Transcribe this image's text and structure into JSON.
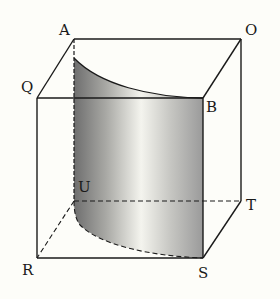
{
  "diagram": {
    "type": "3d-geometry",
    "labels": {
      "A": "A",
      "O": "O",
      "Q": "Q",
      "B": "B",
      "U": "U",
      "T": "T",
      "R": "R",
      "S": "S"
    },
    "vertices": {
      "A": [
        74,
        39
      ],
      "O": [
        241,
        39
      ],
      "Q": [
        37,
        98
      ],
      "B": [
        203,
        98
      ],
      "U": [
        74,
        201
      ],
      "T": [
        241,
        201
      ],
      "R": [
        37,
        258
      ],
      "S": [
        203,
        258
      ]
    },
    "colors": {
      "line": "#1a1a1a",
      "shade_dark": "#6e6e6e",
      "shade_light": "#f4f4ee",
      "shade_right": "#9a9a9a",
      "background": "#fdfdf9"
    }
  }
}
